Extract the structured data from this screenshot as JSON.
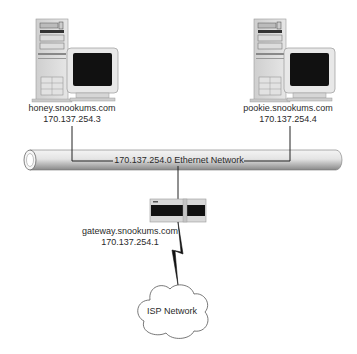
{
  "diagram": {
    "hosts": [
      {
        "name": "honey.snookums.com",
        "ip": "170.137.254.3",
        "icon": "desktop-computer-icon"
      },
      {
        "name": "pookie.snookums.com",
        "ip": "170.137.254.4",
        "icon": "desktop-computer-icon"
      }
    ],
    "network": {
      "label": "170.137.254.0 Ethernet Network",
      "icon": "ethernet-pipe"
    },
    "gateway": {
      "name": "gateway.snookums.com",
      "ip": "170.137.254.1",
      "icon": "router-icon"
    },
    "isp": {
      "label": "ISP Network",
      "icon": "cloud-icon"
    },
    "link": {
      "icon": "lightning-bolt-icon"
    },
    "colors": {
      "line": "#222222",
      "screen": "#111111",
      "case": "#d8d8d8",
      "pipe_light": "#f2f2f2",
      "pipe_dark": "#8c8c8c"
    }
  }
}
